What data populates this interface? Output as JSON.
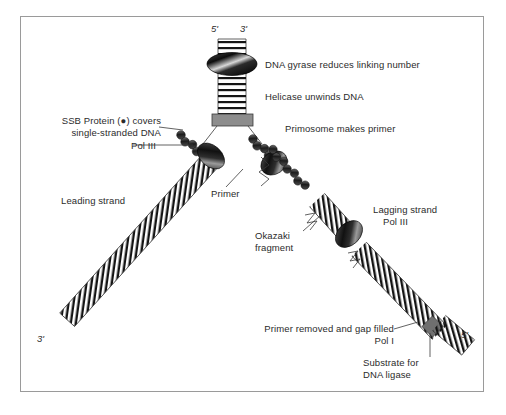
{
  "diagram": {
    "border_color": "#9a9a9a",
    "text_color": "#2b2b2b",
    "labels": {
      "top_five_prime": "5'",
      "top_three_prime": "3'",
      "gyrase": "DNA gyrase reduces linking number",
      "helicase": "Helicase unwinds DNA",
      "primosome": "Primosome makes primer",
      "ssb_line1": "SSB Protein (●) covers",
      "ssb_line2": "single-stranded DNA",
      "pol3_left": "Pol III",
      "primer": "Primer",
      "leading_strand": "Leading strand",
      "okazaki_line1": "Okazaki",
      "okazaki_line2": "fragment",
      "lagging_line1": "Lagging strand",
      "lagging_line2": "Pol III",
      "bottom_left_prime": "3'",
      "bottom_right_prime": "5'",
      "pol1_line1": "Primer removed and gap filled",
      "pol1_line2": "Pol I",
      "ligase_line1": "Substrate for",
      "ligase_line2": "DNA ligase"
    },
    "components": [
      {
        "name": "dna-gyrase",
        "shape": "ellipse",
        "color": "#141414"
      },
      {
        "name": "helicase",
        "shape": "rectangle",
        "color": "#808080"
      },
      {
        "name": "pol-iii-leading",
        "shape": "ellipse",
        "color": "#141414"
      },
      {
        "name": "pol-iii-lagging",
        "shape": "ellipse",
        "color": "#141414"
      },
      {
        "name": "primosome",
        "shape": "ellipse",
        "color": "#141414"
      },
      {
        "name": "ssb-protein",
        "shape": "bead-chain",
        "color": "#4a4a4a"
      },
      {
        "name": "rna-primer",
        "shape": "zigzag",
        "color": "#1a1a1a"
      },
      {
        "name": "pol-i-site",
        "shape": "diamond",
        "color": "#6b6b6b"
      },
      {
        "name": "dna-duplex",
        "shape": "ladder",
        "color": "#1a1a1a"
      }
    ]
  }
}
